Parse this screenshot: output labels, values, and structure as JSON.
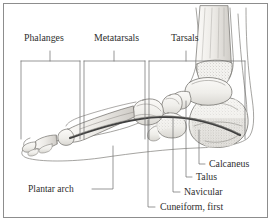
{
  "figure": {
    "background_color": "#ffffff",
    "border_color": "#8d8d8d",
    "ink_color": "#2e2e2e",
    "line_color": "#555555",
    "bone_fill": "#f2f1ee",
    "shade_color": "#b9b7b2",
    "arch_color": "#4a4a4a"
  },
  "top_labels": [
    {
      "id": "phalanges",
      "text": "Phalanges",
      "x": 24,
      "y": 33
    },
    {
      "id": "metatarsals",
      "text": "Metatarsals",
      "x": 94,
      "y": 33
    },
    {
      "id": "tarsals",
      "text": "Tarsals",
      "x": 171,
      "y": 33
    }
  ],
  "callout_labels": [
    {
      "id": "plantar-arch",
      "text": "Plantar arch",
      "x": 28,
      "y": 186
    },
    {
      "id": "cuneiform-first",
      "text": "Cuneiform, first",
      "x": 160,
      "y": 203
    },
    {
      "id": "navicular",
      "text": "Navicular",
      "x": 184,
      "y": 188
    },
    {
      "id": "talus",
      "text": "Talus",
      "x": 196,
      "y": 173
    },
    {
      "id": "calcaneus",
      "text": "Calcaneus",
      "x": 209,
      "y": 160
    }
  ],
  "anatomy_parts": [
    "phalanges",
    "metatarsals",
    "tarsals",
    "calcaneus",
    "talus",
    "navicular",
    "cuneiform-first",
    "plantar-arch",
    "tibia",
    "fibula",
    "soft-tissue-outline"
  ]
}
